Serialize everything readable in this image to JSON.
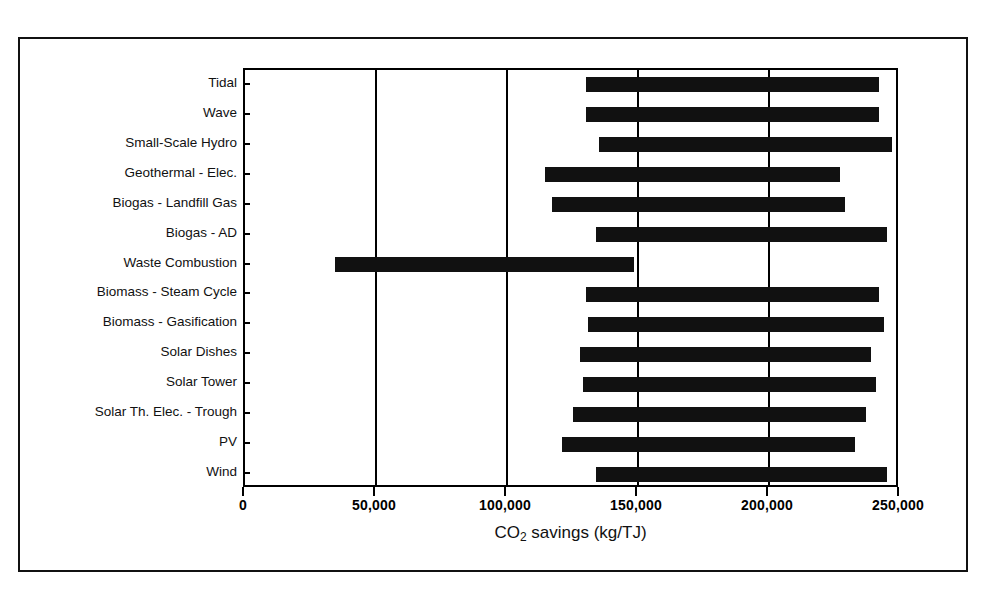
{
  "figure": {
    "axis_title_prefix": "CO",
    "axis_title_sub": "2",
    "axis_title_suffix": " savings (kg/TJ)"
  },
  "chart_data": {
    "type": "bar",
    "orientation": "horizontal",
    "title": "",
    "subtitle": "",
    "xlabel": "CO2 savings (kg/TJ)",
    "ylabel": "",
    "xlim": [
      0,
      250000
    ],
    "xticks": [
      0,
      50000,
      100000,
      150000,
      200000,
      250000
    ],
    "xtick_labels": [
      "0",
      "50,000",
      "100,000",
      "150,000",
      "200,000",
      "250,000"
    ],
    "grid": true,
    "legend": null,
    "note": "Each bar is a range (floating bar) from a low to a high CO2 savings value.",
    "categories": [
      "Tidal",
      "Wave",
      "Small-Scale Hydro",
      "Geothermal - Elec.",
      "Biogas - Landfill Gas",
      "Biogas - AD",
      "Waste Combustion",
      "Biomass - Steam Cycle",
      "Biomass - Gasification",
      "Solar Dishes",
      "Solar Tower",
      "Solar Th. Elec. - Trough",
      "PV",
      "Wind"
    ],
    "series": [
      {
        "name": "CO2 savings range",
        "low": [
          130000,
          130000,
          135000,
          114500,
          117000,
          134000,
          34500,
          130000,
          131000,
          128000,
          129000,
          125000,
          121000,
          134000
        ],
        "high": [
          242000,
          242000,
          247000,
          227000,
          229000,
          245000,
          148500,
          242000,
          244000,
          239000,
          241000,
          237000,
          233000,
          245000
        ]
      }
    ]
  }
}
